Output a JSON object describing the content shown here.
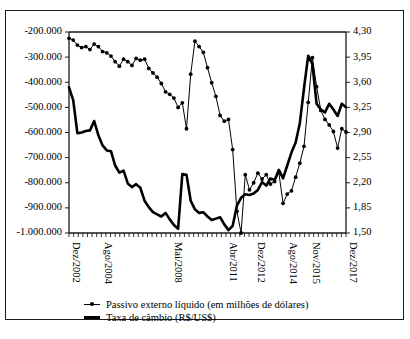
{
  "chart_data": {
    "type": "line",
    "title": "",
    "xlabel": "",
    "ylabel": "",
    "grid": false,
    "legend_position": "bottom-center",
    "x_tick_labels": [
      "Dez/2002",
      "Ago/2004",
      "Mai/2008",
      "Abr/2011",
      "Dez/2012",
      "Ago/2014",
      "Nov/2015",
      "Dez/2017"
    ],
    "x_tick_positions": [
      0,
      7,
      22,
      34,
      40,
      47,
      52,
      60
    ],
    "x_minor_tick_count": 61,
    "left_axis": {
      "label": "Passivo externo líquido (em milhões de dólares)",
      "ticks": [
        "-200.000",
        "-300.000",
        "-400.000",
        "-500.000",
        "-600.000",
        "-700.000",
        "-800.000",
        "-900.000",
        "-1.000.000"
      ],
      "tick_values": [
        -200000,
        -300000,
        -400000,
        -500000,
        -600000,
        -700000,
        -800000,
        -900000,
        -1000000
      ],
      "ylim": [
        -1000000,
        -200000
      ]
    },
    "right_axis": {
      "label": "Taxa de câmbio (R$/US$)",
      "ticks": [
        "4,30",
        "3,95",
        "3,60",
        "3,25",
        "2,90",
        "2,55",
        "2,20",
        "1,85",
        "1,50"
      ],
      "tick_values": [
        4.3,
        3.95,
        3.6,
        3.25,
        2.9,
        2.55,
        2.2,
        1.85,
        1.5
      ],
      "ylim": [
        1.5,
        4.3
      ]
    },
    "series": [
      {
        "name": "Passivo externo líquido (em milhões de dólares)",
        "axis": "left",
        "marker": "filled-circle",
        "line_width": "thin",
        "color": "#000000",
        "values": [
          -225000,
          -232000,
          -252000,
          -262000,
          -258000,
          -270000,
          -248000,
          -258000,
          -278000,
          -283000,
          -296000,
          -318000,
          -336000,
          -308000,
          -318000,
          -333000,
          -305000,
          -312000,
          -308000,
          -345000,
          -363000,
          -380000,
          -405000,
          -438000,
          -448000,
          -463000,
          -500000,
          -482000,
          -585000,
          -368000,
          -236000,
          -258000,
          -281000,
          -342000,
          -402000,
          -456000,
          -532000,
          -555000,
          -548000,
          -668000,
          -913000,
          -1000000,
          -768000,
          -828000,
          -800000,
          -762000,
          -785000,
          -768000,
          -805000,
          -795000,
          -760000,
          -882000,
          -845000,
          -832000,
          -778000,
          -722000,
          -655000,
          -480000,
          -302000,
          -418000,
          -512000,
          -548000,
          -570000,
          -596000,
          -662000,
          -585000,
          -598000
        ]
      },
      {
        "name": "Taxa de câmbio (R$/US$)",
        "axis": "right",
        "marker": "none",
        "line_width": "thick",
        "color": "#000000",
        "values": [
          3.53,
          3.35,
          2.89,
          2.9,
          2.92,
          2.93,
          3.06,
          2.86,
          2.72,
          2.65,
          2.64,
          2.44,
          2.34,
          2.37,
          2.19,
          2.14,
          2.18,
          2.13,
          1.95,
          1.86,
          1.79,
          1.76,
          1.73,
          1.78,
          1.69,
          1.61,
          1.56,
          2.32,
          2.31,
          1.95,
          1.83,
          1.78,
          1.79,
          1.73,
          1.68,
          1.7,
          1.72,
          1.62,
          1.54,
          1.6,
          1.88,
          1.99,
          2.04,
          2.03,
          2.05,
          2.1,
          2.21,
          2.16,
          2.26,
          2.24,
          2.38,
          2.26,
          2.44,
          2.62,
          2.76,
          3.03,
          3.52,
          3.97,
          3.85,
          3.3,
          3.22,
          3.18,
          3.3,
          3.22,
          3.13,
          3.3,
          3.25
        ]
      }
    ]
  },
  "legend": {
    "items": [
      {
        "label": "Passivo externo líquido (em milhões de dólares)",
        "style": "thin"
      },
      {
        "label": "Taxa de câmbio (R$/US$)",
        "style": "thick"
      }
    ]
  },
  "caption": {
    "text": ""
  }
}
